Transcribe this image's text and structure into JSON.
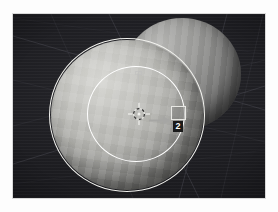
{
  "app": {
    "title": "3D Viewport",
    "mode": "Object Mode"
  },
  "viewport": {
    "name": "3d-viewport",
    "background_color": "#1c1c20",
    "frame_border_color": "#d9d9d9",
    "grid": {
      "visible": true,
      "color": "#3a3a40",
      "type": "perspective-floor-grid"
    }
  },
  "objects": [
    {
      "name": "Sphere",
      "role": "selected-primary",
      "shading": "flat-faceted",
      "fill_color": "#b4b4b0",
      "outline_color": "#f2f2ee",
      "selected": true
    },
    {
      "name": "Sphere.001",
      "role": "background-duplicate",
      "shading": "flat-faceted",
      "fill_color": "#8e8e8c",
      "selected": false
    }
  ],
  "overlays": {
    "falloff_circle": {
      "label": "proportional-editing-falloff",
      "color": "#ffffff",
      "visible": true
    },
    "cursor": {
      "label": "3d-cursor",
      "color": "#e0e0e0"
    },
    "axis_guide": {
      "label": "constraint-axis-guide",
      "color": "#bebebe"
    },
    "drag_arrow": {
      "label": "transform-drag-direction",
      "direction": "right",
      "color": "#9a9a9a"
    },
    "square_handle": {
      "label": "transform-handle",
      "color": "#e8e8e4"
    },
    "step_badge": {
      "value": "2",
      "text_color": "#ffffff",
      "background_color": "#1a1a1a"
    }
  }
}
